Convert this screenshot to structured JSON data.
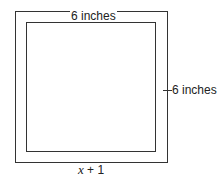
{
  "diagram": {
    "outer_square": {
      "stroke": "#333333"
    },
    "inner_square": {
      "stroke": "#333333"
    },
    "labels": {
      "top": "6 inches",
      "right": "6 inches",
      "bottom_var": "x",
      "bottom_rest": " + 1"
    }
  }
}
